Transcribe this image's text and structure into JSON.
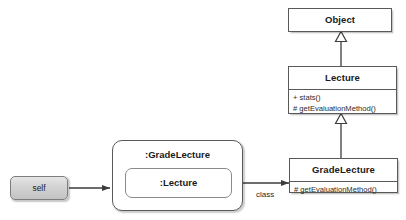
{
  "diagram": {
    "type": "uml-object-class-diagram",
    "background_color": "#ffffff",
    "line_color": "#3d3d3d",
    "box_border_color": "#595959",
    "self_fill_color": "#d4d4d4"
  },
  "self_node": {
    "label": "self"
  },
  "object_node": {
    "name": ":GradeLecture",
    "inner": {
      "name": ":Lecture"
    }
  },
  "classes": {
    "object": {
      "name": "Object",
      "operations": []
    },
    "lecture": {
      "name": "Lecture",
      "operations": [
        "+ stats()",
        "# getEvaluationMethod()"
      ]
    },
    "grade_lecture": {
      "name": "GradeLecture",
      "operations": [
        "# getEvaluationMethod()"
      ]
    }
  },
  "edges": {
    "self_to_object": {
      "label": "",
      "arrow": "open-arrow"
    },
    "object_to_class": {
      "label": "class",
      "arrow": "open-arrow"
    },
    "lecture_generalizes_object": {
      "label": "",
      "arrow": "hollow-triangle"
    },
    "gradelecture_generalizes_lecture": {
      "label": "",
      "arrow": "hollow-triangle"
    }
  }
}
